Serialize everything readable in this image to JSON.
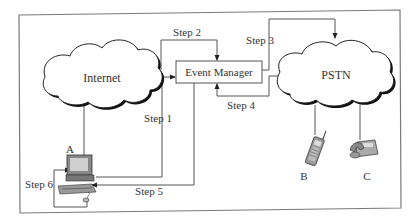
{
  "diagram": {
    "nodes": {
      "internet": {
        "label": "Internet"
      },
      "pstn": {
        "label": "PSTN"
      },
      "event_manager": {
        "label": "Event Manager"
      },
      "computer": {
        "label": "A"
      },
      "mobile_phone": {
        "label": "B"
      },
      "desk_phone": {
        "label": "C"
      }
    },
    "steps": [
      {
        "id": "step1",
        "label": "Step 1",
        "from": "A",
        "to": "Event Manager"
      },
      {
        "id": "step2",
        "label": "Step 2",
        "from": "Internet",
        "to": "Event Manager"
      },
      {
        "id": "step3",
        "label": "Step 3",
        "from": "Event Manager",
        "to": "PSTN"
      },
      {
        "id": "step4",
        "label": "Step 4",
        "from": "PSTN",
        "to": "Event Manager"
      },
      {
        "id": "step5",
        "label": "Step 5",
        "from": "Event Manager",
        "to": "A"
      },
      {
        "id": "step6",
        "label": "Step 6",
        "from": "A",
        "to": "A"
      }
    ],
    "colors": {
      "line": "#555555",
      "text": "#333333",
      "frame": "#7a7a7a"
    }
  }
}
